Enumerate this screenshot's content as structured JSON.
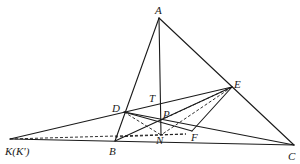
{
  "diagram": {
    "type": "geometry-figure",
    "points": {
      "A": {
        "label": "A",
        "x": 159,
        "y": 18
      },
      "B": {
        "label": "B",
        "x": 115,
        "y": 141
      },
      "C": {
        "label": "C",
        "x": 294,
        "y": 145
      },
      "D": {
        "label": "D",
        "x": 124,
        "y": 112
      },
      "E": {
        "label": "E",
        "x": 232,
        "y": 87
      },
      "F": {
        "label": "F",
        "x": 186,
        "y": 134
      },
      "K": {
        "label": "K(K')",
        "x": 10,
        "y": 139
      },
      "N": {
        "label": "N",
        "x": 161,
        "y": 135
      },
      "P": {
        "label": "P",
        "x": 161,
        "y": 120
      },
      "T": {
        "label": "T",
        "x": 159,
        "y": 104
      }
    },
    "labels": {
      "A": "A",
      "B": "B",
      "C": "C",
      "D": "D",
      "E": "E",
      "F": "F",
      "K": "K(K')",
      "N": "N",
      "P": "P",
      "T": "T"
    },
    "solid_segments": [
      [
        "A",
        "B"
      ],
      [
        "A",
        "C"
      ],
      [
        "K",
        "C"
      ],
      [
        "A",
        "N"
      ],
      [
        "K",
        "E"
      ],
      [
        "D",
        "C"
      ],
      [
        "B",
        "E"
      ],
      [
        "E",
        "F"
      ],
      [
        "D",
        "F"
      ]
    ],
    "dashed_segments": [
      [
        "K",
        "F"
      ],
      [
        "D",
        "N"
      ],
      [
        "E",
        "N"
      ],
      [
        "E",
        "P"
      ],
      [
        "B",
        "N"
      ]
    ],
    "colors": {
      "stroke": "#1a1a1a",
      "background": "#ffffff"
    }
  }
}
